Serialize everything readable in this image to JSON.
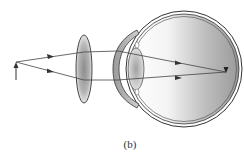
{
  "figure": {
    "caption": "(b)"
  },
  "elements": {
    "object": {
      "type": "arrow",
      "label": ""
    },
    "corrective_lens": {
      "type": "converging lens"
    },
    "eye": {
      "parts": [
        "sclera",
        "cornea",
        "crystalline-lens",
        "retina"
      ]
    },
    "rays": {
      "count": 2,
      "focus": "on retina"
    }
  },
  "colors": {
    "stroke": "#333333",
    "lens_fill_dark": "#8c8c8c",
    "lens_fill_light": "#e6e6e6",
    "eye_fill_dark": "#9a9a9a",
    "eye_fill_light": "#ffffff"
  }
}
